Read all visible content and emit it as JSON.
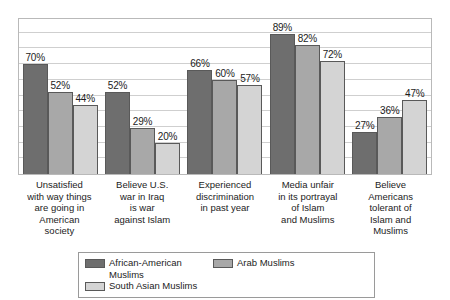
{
  "chart_data": {
    "type": "bar",
    "title": "",
    "subtitle": "",
    "xlabel": "",
    "ylabel": "",
    "ylim": [
      0,
      100
    ],
    "grid": true,
    "gridline_interval": 10,
    "axis_tick_labels": [],
    "legend_position": "bottom",
    "value_label_suffix": "%",
    "categories": [
      "Unsatisfied with way things are going in American society",
      "Believe U.S. war in Iraq is war against Islam",
      "Experienced discrimination in past year",
      "Media unfair in its portrayal of Islam and Muslims",
      "Believe Americans tolerant of Islam and Muslims"
    ],
    "category_lines": [
      [
        "Unsatisfied",
        "with way things",
        "are going in",
        "American",
        "society"
      ],
      [
        "Believe U.S.",
        "war in Iraq",
        "is war",
        "against Islam"
      ],
      [
        "Experienced",
        "discrimination",
        "in past year"
      ],
      [
        "Media unfair",
        "in its portrayal",
        "of Islam",
        "and Muslims"
      ],
      [
        "Believe",
        "Americans",
        "tolerant of",
        "Islam and",
        "Muslims"
      ]
    ],
    "series": [
      {
        "name": "African-American Muslims",
        "color": "#6e6e6e",
        "values": [
          70,
          52,
          66,
          89,
          27
        ],
        "labels": [
          "70%",
          "52%",
          "66%",
          "89%",
          "27%"
        ]
      },
      {
        "name": "Arab Muslims",
        "color": "#a8a8a8",
        "values": [
          52,
          29,
          60,
          82,
          36
        ],
        "labels": [
          "52%",
          "29%",
          "60%",
          "82%",
          "36%"
        ]
      },
      {
        "name": "South Asian Muslims",
        "color": "#d4d4d4",
        "values": [
          44,
          20,
          57,
          72,
          47
        ],
        "labels": [
          "44%",
          "20%",
          "57%",
          "72%",
          "47%"
        ]
      }
    ]
  },
  "legend": {
    "entries": [
      {
        "label": "African-American Muslims",
        "color": "#6e6e6e"
      },
      {
        "label": "Arab Muslims",
        "color": "#a8a8a8"
      },
      {
        "label": "South Asian Muslims",
        "color": "#d4d4d4"
      }
    ]
  }
}
